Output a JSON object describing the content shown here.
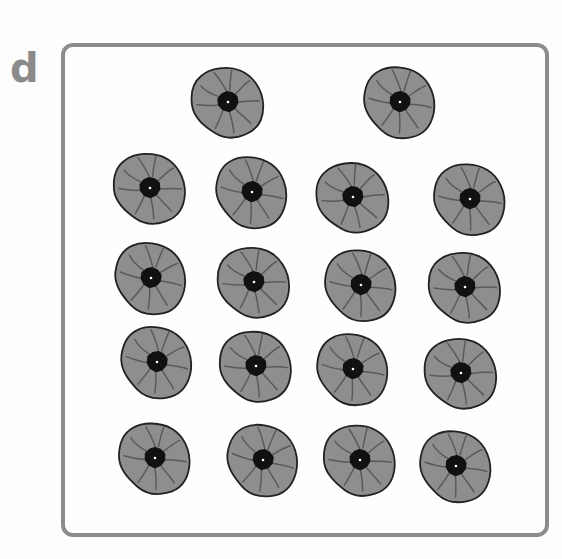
{
  "label": "d",
  "colors": {
    "frame": "#8c8c8c",
    "petal": "#8e8e8e",
    "center": "#111111",
    "label": "#8a8a8a"
  },
  "flowers": {
    "icon": "poppy-flower-icon",
    "count": 18,
    "rows": [
      {
        "count": 2,
        "positions": [
          [
            228,
            102
          ],
          [
            400,
            102
          ]
        ]
      },
      {
        "count": 4,
        "positions": [
          [
            150,
            188
          ],
          [
            252,
            192
          ],
          [
            353,
            197
          ],
          [
            470,
            199
          ]
        ]
      },
      {
        "count": 4,
        "positions": [
          [
            151,
            278
          ],
          [
            254,
            282
          ],
          [
            361,
            285
          ],
          [
            465,
            287
          ]
        ]
      },
      {
        "count": 4,
        "positions": [
          [
            157,
            362
          ],
          [
            256,
            366
          ],
          [
            353,
            369
          ],
          [
            461,
            373
          ]
        ]
      },
      {
        "count": 4,
        "positions": [
          [
            155,
            458
          ],
          [
            263,
            460
          ],
          [
            360,
            460
          ],
          [
            456,
            466
          ]
        ]
      }
    ]
  }
}
